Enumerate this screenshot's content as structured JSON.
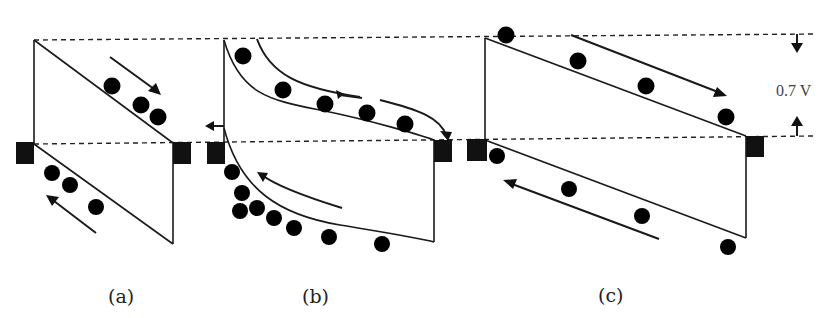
{
  "figure": {
    "panels": [
      {
        "id": "a",
        "caption": "(a)",
        "electrons": 3,
        "holes": 3,
        "electron_flow": "down-right",
        "hole_flow": "up-left"
      },
      {
        "id": "b",
        "caption": "(b)",
        "electrons": 5,
        "holes": 8,
        "electron_flow": "right along curved band",
        "hole_flow": "up-left along curved band"
      },
      {
        "id": "c",
        "caption": "(c)",
        "electrons": 4,
        "holes": 4,
        "electron_flow": "down-right",
        "hole_flow": "up-left"
      }
    ],
    "annotation": {
      "voltage_label": "0.7 V"
    },
    "symbols": {
      "electron": "−",
      "hole": "+"
    }
  }
}
